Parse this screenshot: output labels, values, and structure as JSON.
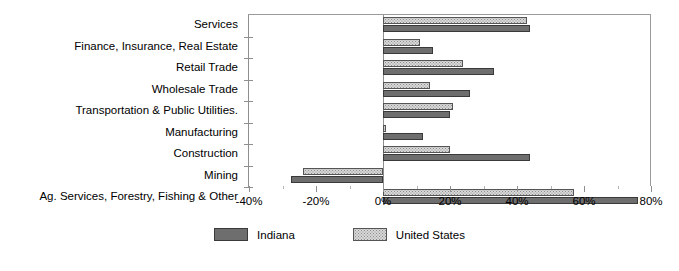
{
  "chart_data": {
    "type": "bar",
    "orientation": "horizontal",
    "title": "",
    "subtitle": "",
    "xlabel": "",
    "ylabel": "",
    "xlim": [
      -40,
      80
    ],
    "xticks": [
      -40,
      -20,
      0,
      20,
      40,
      60,
      80
    ],
    "xtick_labels": [
      "-40%",
      "-20%",
      "0%",
      "20%",
      "40%",
      "60%",
      "80%"
    ],
    "grid": false,
    "legend_position": "bottom",
    "categories": [
      "Services",
      "Finance, Insurance, Real Estate",
      "Retail Trade",
      "Wholesale Trade",
      "Transportation & Public Utilities.",
      "Manufacturing",
      "Construction",
      "Mining",
      "Ag. Services, Forestry, Fishing & Other"
    ],
    "series": [
      {
        "name": "United States",
        "color": "#d8d8d8",
        "values": [
          43,
          11,
          24,
          14,
          21,
          1,
          20,
          -24,
          57
        ]
      },
      {
        "name": "Indiana",
        "color": "#6e6e6e",
        "values": [
          44,
          15,
          33,
          26,
          20,
          12,
          44,
          -27.5,
          76
        ]
      }
    ]
  },
  "legend": {
    "items": [
      {
        "label": "Indiana",
        "swatch": "dark-solid"
      },
      {
        "label": "United States",
        "swatch": "light-dotted"
      }
    ]
  }
}
